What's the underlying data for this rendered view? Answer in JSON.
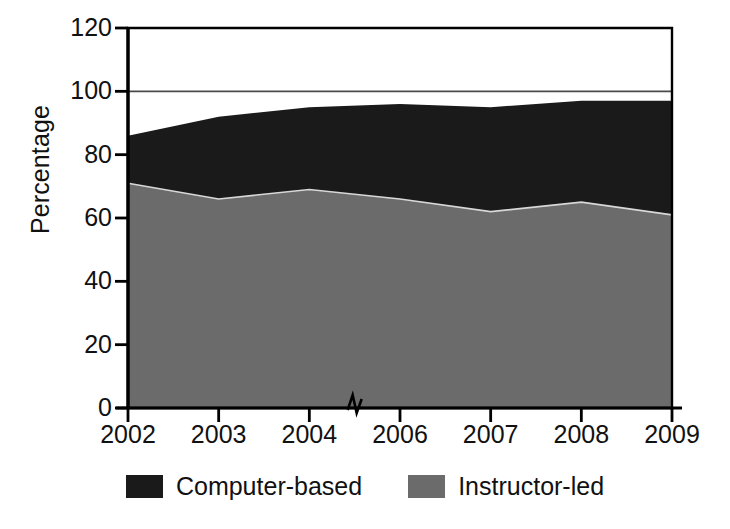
{
  "chart_data": {
    "type": "area",
    "stacked": true,
    "title": "",
    "subtitle": "",
    "xlabel": "",
    "ylabel": "Percentage",
    "categories": [
      "2002",
      "2003",
      "2004",
      "2006",
      "2007",
      "2008",
      "2009"
    ],
    "x_tick_labels": [
      "2002",
      "2003",
      "2004",
      "2006",
      "2007",
      "2008",
      "2009"
    ],
    "y_tick_labels": [
      "0",
      "20",
      "40",
      "60",
      "80",
      "100",
      "120"
    ],
    "y_ticks": [
      0,
      20,
      40,
      60,
      80,
      100,
      120
    ],
    "ylim": [
      0,
      120
    ],
    "grid": false,
    "legend_position": "bottom-center",
    "axis_break": {
      "axis": "x",
      "between": [
        "2004",
        "2006"
      ],
      "marker": "zigzag"
    },
    "reference_lines": [
      {
        "axis": "y",
        "value": 100,
        "label": "100"
      }
    ],
    "series": [
      {
        "name": "Instructor-led",
        "color": "#6b6b6b",
        "values": [
          71,
          66,
          69,
          66,
          62,
          65,
          61
        ]
      },
      {
        "name": "Computer-based",
        "color": "#1a1a1a",
        "values": [
          15,
          26,
          26,
          30,
          33,
          32,
          36
        ]
      }
    ],
    "cumulative_tops": {
      "Instructor-led": [
        71,
        66,
        69,
        66,
        62,
        65,
        61
      ],
      "Computer-based": [
        86,
        92,
        95,
        96,
        95,
        97,
        97
      ]
    },
    "legend": [
      {
        "label": "Computer-based",
        "color": "#1a1a1a"
      },
      {
        "label": "Instructor-led",
        "color": "#6b6b6b"
      }
    ]
  },
  "colors": {
    "computer_based": "#1a1a1a",
    "instructor_led": "#6b6b6b",
    "axis": "#000000",
    "reference_line": "#4a4a4a",
    "background": "#ffffff"
  }
}
